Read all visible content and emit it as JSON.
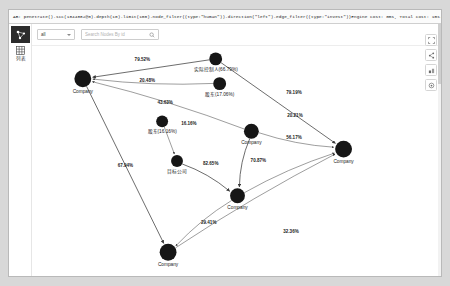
{
  "window": {
    "query_bar": {
      "query": "AB: penetrate().scc(1844882@0).depth(10).limit(100).node_filter((type:\"human\")).direction(\"left\").edge_filter((type:\"invest\"))Engine cost: 0ms, Total cost: 1ms."
    },
    "toolbar": {
      "scope_select": {
        "value": "all",
        "caret_icon": "chevron-down-icon"
      },
      "search": {
        "placeholder": "Search Nodes By id",
        "value": "",
        "icon": "search-icon"
      }
    },
    "left_rail": {
      "logo_icon": "graph-logo-icon",
      "items": [
        {
          "label": "列表",
          "icon": "list-grid-icon"
        }
      ]
    },
    "right_tools": [
      {
        "name": "fullscreen-icon"
      },
      {
        "name": "link-share-icon"
      },
      {
        "name": "layers-icon"
      },
      {
        "name": "settings-icon"
      }
    ]
  },
  "graph": {
    "nodes": [
      {
        "id": "n1",
        "label": "Company",
        "x": 45,
        "y": 33,
        "r": 8.5
      },
      {
        "id": "n2",
        "label": "实际控制人(66.79%)",
        "x": 179,
        "y": 13,
        "r": 6.5
      },
      {
        "id": "n3",
        "label": "股东(17.06%)",
        "x": 183,
        "y": 38,
        "r": 6.5
      },
      {
        "id": "n4",
        "label": "股东(16.16%)",
        "x": 125,
        "y": 76,
        "r": 6.0
      },
      {
        "id": "n5",
        "label": "Company",
        "x": 215,
        "y": 86,
        "r": 7.5
      },
      {
        "id": "n6",
        "label": "Company",
        "x": 308,
        "y": 104,
        "r": 8.5
      },
      {
        "id": "n7",
        "label": "目标公司",
        "x": 140,
        "y": 116,
        "r": 6.0
      },
      {
        "id": "n8",
        "label": "Company",
        "x": 201,
        "y": 151,
        "r": 7.5
      },
      {
        "id": "n9",
        "label": "Company",
        "x": 131,
        "y": 208,
        "r": 8.5
      }
    ],
    "edges": [
      {
        "from": "n2",
        "to": "n1",
        "label": "79.52%",
        "lx": 105,
        "ly": 15
      },
      {
        "from": "n3",
        "to": "n1",
        "label": "20.48%",
        "lx": 110,
        "ly": 36
      },
      {
        "from": "n5",
        "to": "n1",
        "label": "43.63%",
        "lx": 128,
        "ly": 58
      },
      {
        "from": "n2",
        "to": "n6",
        "label": "79.19%",
        "lx": 258,
        "ly": 48
      },
      {
        "from": "n5",
        "to": "n6",
        "label": "20.21%",
        "lx": 259,
        "ly": 72
      },
      {
        "from": "n8",
        "to": "n6",
        "label": "56.17%",
        "lx": 258,
        "ly": 94
      },
      {
        "from": "n4",
        "to": "n7",
        "label": "16.16%",
        "lx": 152,
        "ly": 80
      },
      {
        "from": "n7",
        "to": "n8",
        "label": "82.65%",
        "lx": 174,
        "ly": 120
      },
      {
        "from": "n5",
        "to": "n8",
        "label": "70.87%",
        "lx": 222,
        "ly": 117
      },
      {
        "from": "n1",
        "to": "n9",
        "label": "67.94%",
        "lx": 88,
        "ly": 122
      },
      {
        "from": "n8",
        "to": "n9",
        "label": "29.41%",
        "lx": 172,
        "ly": 180
      },
      {
        "from": "n9",
        "to": "n6",
        "label": "32.36%",
        "lx": 255,
        "ly": 189
      }
    ]
  },
  "colors": {
    "node": "#161616",
    "edge": "#5b5b5b",
    "panel": "#ffffff",
    "desktop": "#d8d8d8",
    "border": "#b9b9b9"
  }
}
